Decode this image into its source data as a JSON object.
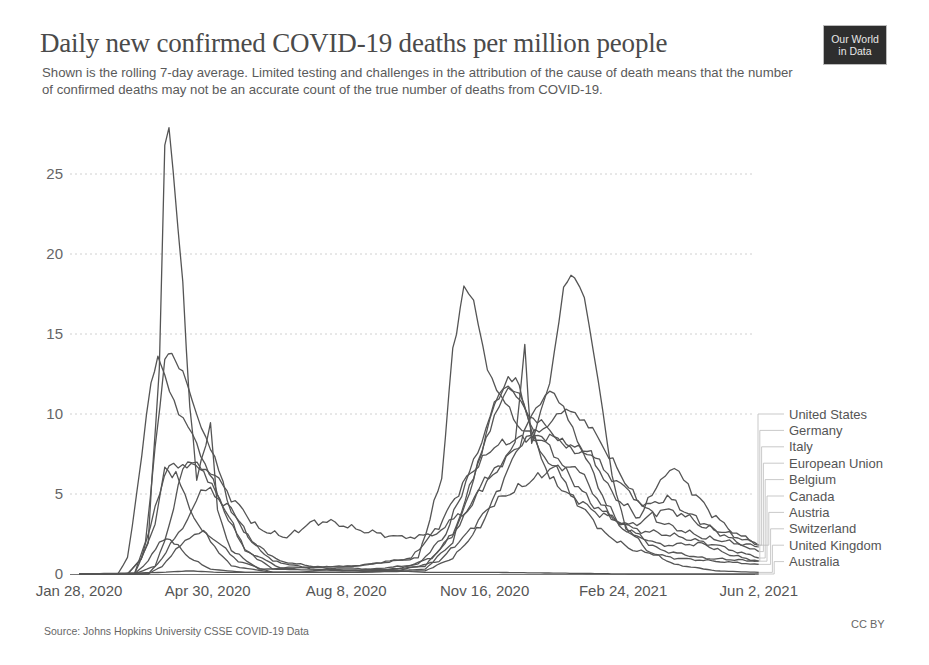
{
  "header": {
    "title": "Daily new confirmed COVID-19 deaths per million people",
    "subtitle": "Shown is the rolling 7-day average. Limited testing and challenges in the attribution of the cause of death means that the number of confirmed deaths may not be an accurate count of the true number of deaths from COVID-19.",
    "logo_line1": "Our World",
    "logo_line2": "in Data"
  },
  "footer": {
    "source": "Source: Johns Hopkins University CSSE COVID-19 Data",
    "license": "CC BY"
  },
  "colors": {
    "line": "#555555",
    "grid": "#d0d0d0",
    "axis": "#777777",
    "logo_bg": "#2e2e2e"
  },
  "chart_data": {
    "type": "line",
    "title": "Daily new confirmed COVID-19 deaths per million people",
    "subtitle": "Shown is the rolling 7-day average.",
    "xlabel": "",
    "ylabel": "",
    "x_tick_labels": [
      "Jan 28, 2020",
      "Apr 30, 2020",
      "Aug 8, 2020",
      "Nov 16, 2020",
      "Feb 24, 2021",
      "Jun 2, 2021"
    ],
    "x_tick_days": [
      0,
      93,
      193,
      293,
      393,
      491
    ],
    "y_ticks": [
      0,
      5,
      10,
      15,
      20,
      25
    ],
    "ylim": [
      0,
      28.5
    ],
    "xlim_days": [
      0,
      491
    ],
    "grid": "horizontal-dotted",
    "legend_position": "right-end-labels",
    "x_unit": "days since Jan 28, 2020",
    "series": [
      {
        "name": "United States",
        "points": [
          [
            0,
            0
          ],
          [
            40,
            0
          ],
          [
            55,
            0.5
          ],
          [
            65,
            3
          ],
          [
            75,
            6.5
          ],
          [
            82,
            6.9
          ],
          [
            95,
            6.5
          ],
          [
            110,
            4.8
          ],
          [
            130,
            2.8
          ],
          [
            150,
            2.3
          ],
          [
            170,
            3.3
          ],
          [
            185,
            3.2
          ],
          [
            200,
            2.8
          ],
          [
            230,
            2.3
          ],
          [
            255,
            2.4
          ],
          [
            280,
            4
          ],
          [
            300,
            6.5
          ],
          [
            320,
            8.2
          ],
          [
            345,
            9.8
          ],
          [
            355,
            10.2
          ],
          [
            365,
            9.7
          ],
          [
            380,
            7.8
          ],
          [
            400,
            5
          ],
          [
            420,
            3.2
          ],
          [
            450,
            2.3
          ],
          [
            470,
            2
          ],
          [
            491,
            1.7
          ]
        ]
      },
      {
        "name": "Germany",
        "points": [
          [
            0,
            0
          ],
          [
            50,
            0
          ],
          [
            60,
            0.5
          ],
          [
            70,
            1.5
          ],
          [
            80,
            2.2
          ],
          [
            90,
            2.8
          ],
          [
            100,
            2
          ],
          [
            115,
            0.8
          ],
          [
            140,
            0.1
          ],
          [
            200,
            0.1
          ],
          [
            250,
            0.2
          ],
          [
            270,
            1
          ],
          [
            290,
            3
          ],
          [
            310,
            6.5
          ],
          [
            330,
            10.5
          ],
          [
            340,
            11.5
          ],
          [
            350,
            10.2
          ],
          [
            360,
            8.5
          ],
          [
            375,
            5.5
          ],
          [
            390,
            3
          ],
          [
            420,
            1.8
          ],
          [
            450,
            1.9
          ],
          [
            470,
            1.2
          ],
          [
            491,
            0.8
          ]
        ]
      },
      {
        "name": "Italy",
        "points": [
          [
            0,
            0
          ],
          [
            28,
            0
          ],
          [
            35,
            1
          ],
          [
            42,
            5
          ],
          [
            52,
            12
          ],
          [
            57,
            13.5
          ],
          [
            62,
            12.5
          ],
          [
            72,
            10
          ],
          [
            85,
            8.2
          ],
          [
            100,
            5
          ],
          [
            120,
            1.5
          ],
          [
            140,
            0.3
          ],
          [
            200,
            0.2
          ],
          [
            245,
            0.6
          ],
          [
            265,
            2.5
          ],
          [
            285,
            7
          ],
          [
            300,
            10.5
          ],
          [
            310,
            12
          ],
          [
            322,
            10.2
          ],
          [
            340,
            9
          ],
          [
            355,
            7.8
          ],
          [
            370,
            7.5
          ],
          [
            385,
            5
          ],
          [
            405,
            3.5
          ],
          [
            420,
            6
          ],
          [
            430,
            6.5
          ],
          [
            440,
            5.5
          ],
          [
            460,
            3.5
          ],
          [
            475,
            2.5
          ],
          [
            491,
            1.8
          ]
        ]
      },
      {
        "name": "European Union",
        "points": [
          [
            0,
            0
          ],
          [
            35,
            0
          ],
          [
            45,
            1
          ],
          [
            55,
            4
          ],
          [
            65,
            6.8
          ],
          [
            75,
            6.9
          ],
          [
            90,
            6.5
          ],
          [
            105,
            4
          ],
          [
            120,
            1.5
          ],
          [
            145,
            0.4
          ],
          [
            200,
            0.5
          ],
          [
            240,
            1
          ],
          [
            260,
            3
          ],
          [
            280,
            6
          ],
          [
            300,
            8
          ],
          [
            320,
            8.5
          ],
          [
            340,
            8.6
          ],
          [
            355,
            8
          ],
          [
            370,
            7.5
          ],
          [
            385,
            6
          ],
          [
            410,
            4.2
          ],
          [
            425,
            4.8
          ],
          [
            440,
            3.8
          ],
          [
            460,
            2.7
          ],
          [
            475,
            2
          ],
          [
            491,
            1.4
          ]
        ]
      },
      {
        "name": "Belgium",
        "points": [
          [
            0,
            0
          ],
          [
            40,
            0
          ],
          [
            50,
            2
          ],
          [
            58,
            13
          ],
          [
            62,
            27
          ],
          [
            65,
            28
          ],
          [
            68,
            25
          ],
          [
            75,
            18
          ],
          [
            80,
            10.5
          ],
          [
            85,
            6
          ],
          [
            95,
            9.5
          ],
          [
            100,
            4
          ],
          [
            110,
            1.5
          ],
          [
            130,
            0.3
          ],
          [
            200,
            0.5
          ],
          [
            245,
            1
          ],
          [
            262,
            6
          ],
          [
            270,
            14
          ],
          [
            278,
            17.8
          ],
          [
            285,
            17
          ],
          [
            295,
            13
          ],
          [
            305,
            11
          ],
          [
            320,
            9
          ],
          [
            340,
            8
          ],
          [
            355,
            6
          ],
          [
            375,
            4
          ],
          [
            400,
            2.8
          ],
          [
            430,
            2.4
          ],
          [
            460,
            1.8
          ],
          [
            491,
            1.0
          ]
        ]
      },
      {
        "name": "Canada",
        "points": [
          [
            0,
            0
          ],
          [
            50,
            0
          ],
          [
            60,
            1
          ],
          [
            75,
            3
          ],
          [
            88,
            5
          ],
          [
            95,
            5.2
          ],
          [
            110,
            4
          ],
          [
            125,
            2
          ],
          [
            140,
            0.8
          ],
          [
            170,
            0.3
          ],
          [
            230,
            0.2
          ],
          [
            260,
            0.8
          ],
          [
            280,
            2.5
          ],
          [
            300,
            4.5
          ],
          [
            320,
            5.5
          ],
          [
            340,
            6.5
          ],
          [
            355,
            6.8
          ],
          [
            365,
            6
          ],
          [
            380,
            4
          ],
          [
            400,
            2.5
          ],
          [
            420,
            1.5
          ],
          [
            450,
            1
          ],
          [
            491,
            0.8
          ]
        ]
      },
      {
        "name": "Austria",
        "points": [
          [
            0,
            0
          ],
          [
            40,
            0
          ],
          [
            50,
            0.8
          ],
          [
            58,
            2
          ],
          [
            66,
            2.2
          ],
          [
            80,
            1
          ],
          [
            95,
            0.3
          ],
          [
            120,
            0.1
          ],
          [
            200,
            0.1
          ],
          [
            250,
            0.5
          ],
          [
            270,
            2.5
          ],
          [
            285,
            6
          ],
          [
            300,
            10.5
          ],
          [
            310,
            12.4
          ],
          [
            318,
            11.8
          ],
          [
            330,
            8
          ],
          [
            345,
            6.5
          ],
          [
            355,
            5
          ],
          [
            370,
            4
          ],
          [
            400,
            3
          ],
          [
            420,
            4
          ],
          [
            435,
            3.8
          ],
          [
            450,
            3
          ],
          [
            470,
            2.5
          ],
          [
            491,
            1.8
          ]
        ]
      },
      {
        "name": "Switzerland",
        "points": [
          [
            0,
            0
          ],
          [
            35,
            0
          ],
          [
            45,
            1
          ],
          [
            55,
            3
          ],
          [
            62,
            6.5
          ],
          [
            70,
            6.2
          ],
          [
            80,
            4
          ],
          [
            95,
            2
          ],
          [
            110,
            0.5
          ],
          [
            140,
            0.1
          ],
          [
            200,
            0.1
          ],
          [
            250,
            0.3
          ],
          [
            270,
            2
          ],
          [
            285,
            6
          ],
          [
            300,
            10
          ],
          [
            310,
            11.5
          ],
          [
            318,
            11.4
          ],
          [
            325,
            9.5
          ],
          [
            340,
            6
          ],
          [
            360,
            4.5
          ],
          [
            380,
            2.5
          ],
          [
            400,
            1.5
          ],
          [
            430,
            1
          ],
          [
            460,
            0.8
          ],
          [
            491,
            0.6
          ]
        ]
      },
      {
        "name": "United Kingdom",
        "points": [
          [
            0,
            0
          ],
          [
            40,
            0
          ],
          [
            48,
            2
          ],
          [
            55,
            8
          ],
          [
            62,
            13.5
          ],
          [
            67,
            13.8
          ],
          [
            75,
            12.5
          ],
          [
            85,
            10
          ],
          [
            95,
            8
          ],
          [
            110,
            4
          ],
          [
            125,
            2
          ],
          [
            145,
            0.8
          ],
          [
            190,
            0.2
          ],
          [
            230,
            0.3
          ],
          [
            255,
            1
          ],
          [
            275,
            3
          ],
          [
            290,
            5.5
          ],
          [
            305,
            6.8
          ],
          [
            315,
            8
          ],
          [
            322,
            14.2
          ],
          [
            327,
            8
          ],
          [
            340,
            12
          ],
          [
            350,
            18
          ],
          [
            358,
            18.7
          ],
          [
            365,
            17.5
          ],
          [
            375,
            12
          ],
          [
            385,
            6
          ],
          [
            395,
            3
          ],
          [
            410,
            1.5
          ],
          [
            430,
            0.6
          ],
          [
            460,
            0.2
          ],
          [
            491,
            0.1
          ]
        ]
      },
      {
        "name": "Australia",
        "points": [
          [
            0,
            0
          ],
          [
            60,
            0.1
          ],
          [
            80,
            0.2
          ],
          [
            100,
            0.1
          ],
          [
            160,
            0.1
          ],
          [
            190,
            0.4
          ],
          [
            210,
            0.3
          ],
          [
            250,
            0.1
          ],
          [
            300,
            0.1
          ],
          [
            400,
            0
          ],
          [
            491,
            0
          ]
        ]
      }
    ]
  }
}
